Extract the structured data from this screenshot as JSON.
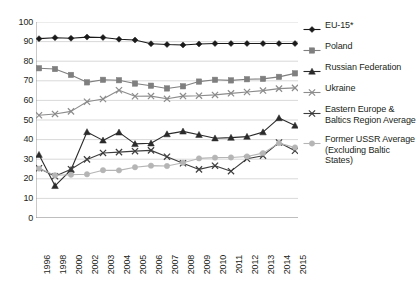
{
  "chart_data": {
    "type": "line",
    "title": "",
    "subtitle": "",
    "xlabel": "",
    "ylabel": "",
    "ylim": [
      0,
      100
    ],
    "y_ticks": [
      0,
      10,
      20,
      30,
      40,
      50,
      60,
      70,
      80,
      90,
      100
    ],
    "grid": "horizontal",
    "legend_position": "right",
    "categories": [
      "1996",
      "1998",
      "2000",
      "2002",
      "2003",
      "2004",
      "2005",
      "2006",
      "2007",
      "2008",
      "2009",
      "2010",
      "2011",
      "2012",
      "2013",
      "2014",
      "2015"
    ],
    "series": [
      {
        "name": "EU-15*",
        "color": "#1a1a1a",
        "marker": "diamond",
        "values": [
          91.5,
          92.0,
          91.7,
          92.3,
          92.1,
          91.2,
          90.8,
          88.9,
          88.5,
          88.3,
          88.8,
          89.0,
          89.0,
          89.0,
          89.0,
          89.0,
          89.0
        ]
      },
      {
        "name": "Poland",
        "color": "#7f7f7f",
        "marker": "square",
        "values": [
          76.4,
          76.0,
          73.0,
          69.2,
          70.5,
          70.3,
          68.6,
          67.5,
          66.1,
          67.2,
          69.6,
          70.5,
          70.2,
          70.8,
          71.0,
          72.0,
          73.8
        ]
      },
      {
        "name": "Russian Federation",
        "color": "#2b2b2b",
        "marker": "triangle",
        "values": [
          32.3,
          16.4,
          24.6,
          43.9,
          39.6,
          43.7,
          37.8,
          38.1,
          42.8,
          44.2,
          42.5,
          40.7,
          41.0,
          41.5,
          43.8,
          51.0,
          47.2
        ]
      },
      {
        "name": "Ukraine",
        "color": "#8c8c8c",
        "marker": "cross",
        "values": [
          52.4,
          53.1,
          54.4,
          59.3,
          60.7,
          65.2,
          62.1,
          62.2,
          60.8,
          62.2,
          62.4,
          62.8,
          63.6,
          64.3,
          65.0,
          66.0,
          66.4
        ]
      },
      {
        "name": "Eastern Europe & Baltics Region Average",
        "color": "#3d3d3d",
        "marker": "cross",
        "values": [
          25.4,
          21.3,
          24.9,
          29.9,
          33.2,
          33.6,
          34.1,
          34.5,
          31.3,
          27.9,
          24.8,
          26.7,
          23.9,
          30.2,
          31.8,
          38.5,
          34.3
        ]
      },
      {
        "name": "Former USSR Average (Excluding Baltic States)",
        "color": "#b5b5b5",
        "marker": "circle",
        "values": [
          25.2,
          21.8,
          22.1,
          22.3,
          24.4,
          24.3,
          25.9,
          26.7,
          26.5,
          28.2,
          30.4,
          30.8,
          30.9,
          31.4,
          33.1,
          38.2,
          36.0
        ]
      }
    ]
  },
  "legend": {
    "items": [
      {
        "label": "EU-15*"
      },
      {
        "label": "Poland"
      },
      {
        "label": "Russian Federation"
      },
      {
        "label": "Ukraine"
      },
      {
        "label": "Eastern Europe & Baltics Region Average"
      },
      {
        "label": "Former USSR Average (Excluding Baltic States)"
      }
    ]
  }
}
